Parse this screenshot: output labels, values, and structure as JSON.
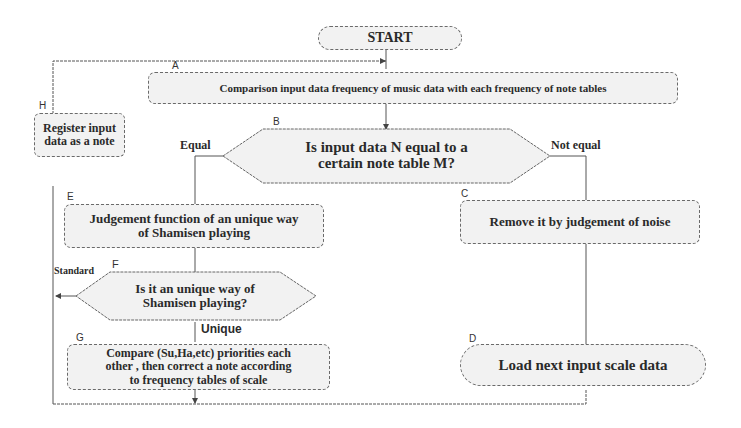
{
  "diagram": {
    "type": "flowchart",
    "nodes": {
      "start": {
        "label": "START",
        "shape": "terminator"
      },
      "A": {
        "id_label": "A",
        "label": "Comparison input data frequency of music data with each frequency of note tables",
        "shape": "process"
      },
      "B": {
        "id_label": "B",
        "label_line1": "Is input data N equal to a",
        "label_line2": "certain note table M?",
        "shape": "decision"
      },
      "C": {
        "id_label": "C",
        "label": "Remove it by judgement of noise",
        "shape": "process"
      },
      "D": {
        "id_label": "D",
        "label": "Load next input scale data",
        "shape": "terminator"
      },
      "E": {
        "id_label": "E",
        "label_line1": "Judgement function of an unique way",
        "label_line2": "of Shamisen playing",
        "shape": "process"
      },
      "F": {
        "id_label": "F",
        "label_line1": "Is it an unique way of",
        "label_line2": "Shamisen playing?",
        "shape": "decision"
      },
      "G": {
        "id_label": "G",
        "label_line1": "Compare (Su,Ha,etc) priorities each",
        "label_line2": "other , then correct a note according",
        "label_line3": "to frequency tables of scale",
        "shape": "process"
      },
      "H": {
        "id_label": "H",
        "label_line1": "Register input",
        "label_line2": "data as a note",
        "shape": "process"
      }
    },
    "edge_labels": {
      "equal": "Equal",
      "not_equal": "Not equal",
      "standard": "Standard",
      "unique": "Unique"
    },
    "edges": [
      {
        "from": "START",
        "to": "A"
      },
      {
        "from": "A",
        "to": "B"
      },
      {
        "from": "B",
        "to": "E",
        "label": "Equal"
      },
      {
        "from": "B",
        "to": "C",
        "label": "Not equal"
      },
      {
        "from": "C",
        "to": "D"
      },
      {
        "from": "E",
        "to": "F"
      },
      {
        "from": "F",
        "to": "G",
        "label": "Unique"
      },
      {
        "from": "F",
        "to": "H",
        "label": "Standard"
      },
      {
        "from": "G",
        "to": "H"
      },
      {
        "from": "D",
        "to": "H"
      },
      {
        "from": "H",
        "to": "A"
      }
    ],
    "colors": {
      "line": "#555555",
      "fill": "#f2f2f2",
      "text": "#2a2a2a"
    }
  }
}
